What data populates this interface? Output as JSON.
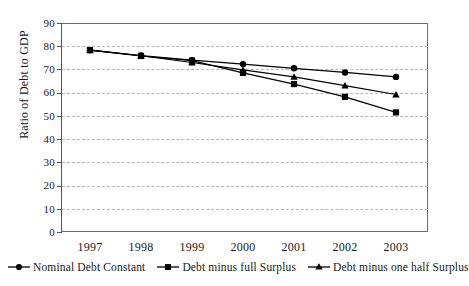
{
  "chart_data": {
    "type": "line",
    "title": "",
    "xlabel": "",
    "ylabel": "Ratio of Debt to GDP",
    "categories": [
      "1997",
      "1998",
      "1999",
      "2000",
      "2001",
      "2002",
      "2003"
    ],
    "ylim": [
      0,
      90
    ],
    "ytick_step": 10,
    "yticks": [
      "90",
      "80",
      "70",
      "60",
      "50",
      "40",
      "30",
      "20",
      "10",
      "0"
    ],
    "grid": true,
    "legend_position": "bottom",
    "series": [
      {
        "name": "Nominal Debt  Constant",
        "marker": "circle",
        "color": "#000000",
        "values": [
          78.3,
          76.0,
          74.0,
          72.3,
          70.5,
          68.7,
          66.8
        ]
      },
      {
        "name": "Debt minus full Surplus",
        "marker": "square",
        "color": "#000000",
        "values": [
          78.3,
          75.8,
          73.8,
          68.5,
          63.7,
          58.2,
          51.5
        ]
      },
      {
        "name": "Debt minus one half Surplus",
        "marker": "triangle",
        "color": "#000000",
        "values": [
          78.3,
          75.9,
          73.0,
          69.8,
          66.8,
          63.0,
          59.2
        ]
      }
    ]
  },
  "axes": {
    "y_title": "Ratio of Debt to GDP"
  }
}
